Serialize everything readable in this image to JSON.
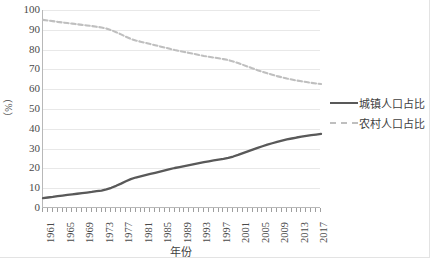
{
  "chart_data": {
    "type": "line",
    "title": "",
    "xlabel": "年份",
    "ylabel": "（%）",
    "ylim": [
      0,
      100
    ],
    "ytick_step": 10,
    "yticks": [
      100,
      90,
      80,
      70,
      60,
      50,
      40,
      30,
      20,
      10,
      0
    ],
    "grid": true,
    "legend_position": "right",
    "x": [
      1961,
      1962,
      1963,
      1964,
      1965,
      1966,
      1967,
      1968,
      1969,
      1970,
      1971,
      1972,
      1973,
      1974,
      1975,
      1976,
      1977,
      1978,
      1979,
      1980,
      1981,
      1982,
      1983,
      1984,
      1985,
      1986,
      1987,
      1988,
      1989,
      1990,
      1991,
      1992,
      1993,
      1994,
      1995,
      1996,
      1997,
      1998,
      1999,
      2000,
      2001,
      2002,
      2003,
      2004,
      2005,
      2006,
      2007,
      2008,
      2009,
      2010,
      2011,
      2012,
      2013,
      2014,
      2015,
      2016,
      2017,
      2018
    ],
    "xtick_labels": [
      "1961",
      "1965",
      "1969",
      "1973",
      "1977",
      "1981",
      "1985",
      "1989",
      "1993",
      "1997",
      "2001",
      "2005",
      "2009",
      "2013",
      "2017"
    ],
    "series": [
      {
        "name": "城镇人口占比",
        "color": "#595959",
        "style": "solid",
        "values": [
          5.0,
          5.3,
          5.6,
          6.0,
          6.3,
          6.6,
          6.9,
          7.2,
          7.5,
          7.8,
          8.1,
          8.5,
          8.8,
          9.4,
          10.2,
          11.2,
          12.3,
          13.5,
          14.6,
          15.4,
          16.0,
          16.6,
          17.2,
          17.8,
          18.4,
          19.0,
          19.6,
          20.2,
          20.7,
          21.2,
          21.7,
          22.2,
          22.7,
          23.2,
          23.6,
          24.0,
          24.4,
          24.8,
          25.3,
          26.0,
          26.8,
          27.7,
          28.6,
          29.5,
          30.4,
          31.2,
          32.0,
          32.7,
          33.4,
          34.0,
          34.6,
          35.1,
          35.6,
          36.0,
          36.4,
          36.8,
          37.1,
          37.4
        ]
      },
      {
        "name": "农村人口占比",
        "color": "#bfbfbf",
        "style": "dashed",
        "values": [
          95.0,
          94.7,
          94.4,
          94.0,
          93.7,
          93.4,
          93.1,
          92.8,
          92.5,
          92.2,
          91.9,
          91.5,
          91.2,
          90.6,
          89.8,
          88.8,
          87.7,
          86.5,
          85.4,
          84.6,
          84.0,
          83.4,
          82.8,
          82.2,
          81.6,
          81.0,
          80.4,
          79.8,
          79.3,
          78.8,
          78.3,
          77.8,
          77.3,
          76.8,
          76.4,
          76.0,
          75.6,
          75.2,
          74.7,
          74.0,
          73.2,
          72.3,
          71.4,
          70.5,
          69.6,
          68.8,
          68.0,
          67.3,
          66.6,
          66.0,
          65.4,
          64.9,
          64.4,
          64.0,
          63.6,
          63.2,
          62.9,
          62.6
        ]
      }
    ]
  },
  "legend": {
    "items": [
      {
        "label": "城镇人口占比",
        "color": "#595959",
        "style": "solid"
      },
      {
        "label": "农村人口占比",
        "color": "#bfbfbf",
        "style": "dashed"
      }
    ]
  },
  "axes": {
    "x_title": "年份",
    "y_title": "（%）"
  }
}
